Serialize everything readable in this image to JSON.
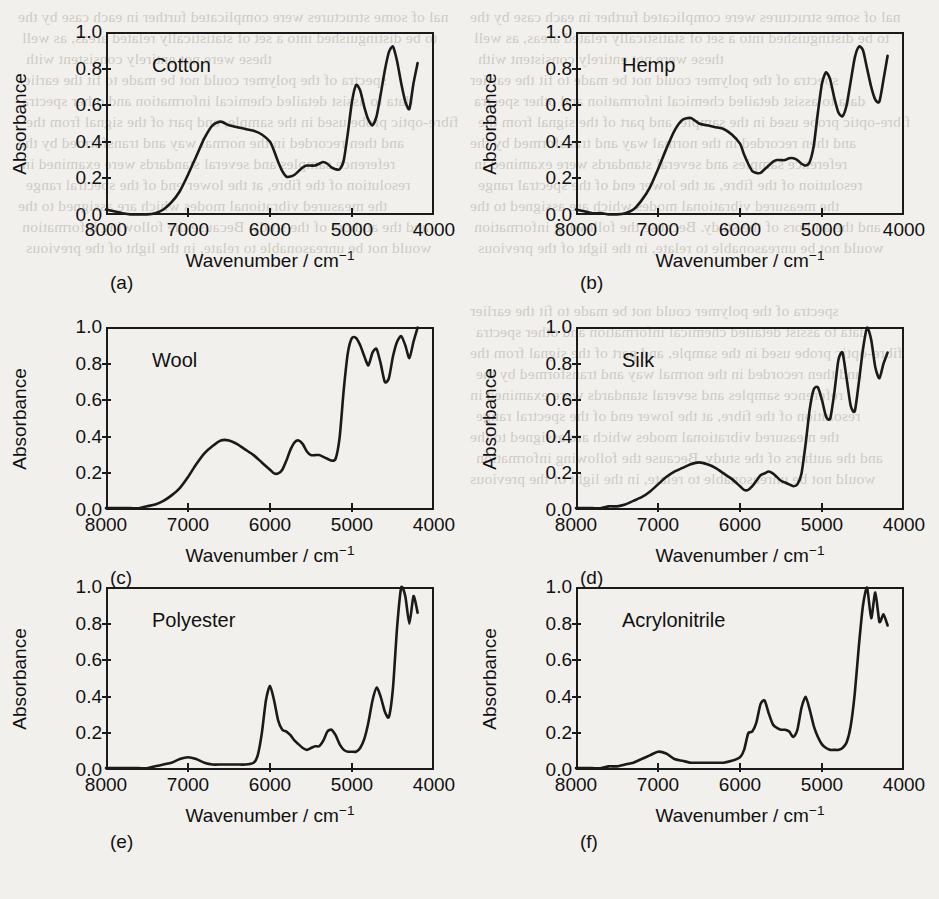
{
  "figure": {
    "background": "#f2f0ec",
    "ink": "#1a1a1a",
    "axis": {
      "xlabel_text": "Wavenumber / cm",
      "xlabel_exponent": "−1",
      "ylabel": "Absorbance",
      "xticks": [
        "8000",
        "7000",
        "6000",
        "5000",
        "4000"
      ],
      "xtick_values": [
        8000,
        7000,
        6000,
        5000,
        4000
      ],
      "yticks": [
        "0.0",
        "0.2",
        "0.4",
        "0.6",
        "0.8",
        "1.0"
      ],
      "ytick_values": [
        0.0,
        0.2,
        0.4,
        0.6,
        0.8,
        1.0
      ],
      "xlim": [
        8000,
        4000
      ],
      "ylim": [
        0.0,
        1.0
      ]
    },
    "panels": [
      {
        "tag": "(a)",
        "name": "Cotton"
      },
      {
        "tag": "(b)",
        "name": "Hemp"
      },
      {
        "tag": "(c)",
        "name": "Wool"
      },
      {
        "tag": "(d)",
        "name": "Silk"
      },
      {
        "tag": "(e)",
        "name": "Polyester"
      },
      {
        "tag": "(f)",
        "name": "Acrylonitrile"
      }
    ]
  },
  "chart_data": [
    {
      "type": "line",
      "panel": "(a)",
      "title": "Cotton",
      "xlabel": "Wavenumber / cm-1",
      "ylabel": "Absorbance",
      "xlim": [
        8000,
        4000
      ],
      "ylim": [
        0.0,
        1.0
      ],
      "grid": false,
      "legend": "none",
      "x": [
        8000,
        7900,
        7800,
        7700,
        7600,
        7500,
        7400,
        7300,
        7200,
        7100,
        7000,
        6900,
        6800,
        6700,
        6600,
        6500,
        6400,
        6300,
        6200,
        6100,
        6000,
        5950,
        5900,
        5850,
        5800,
        5750,
        5700,
        5650,
        5600,
        5550,
        5500,
        5450,
        5400,
        5350,
        5300,
        5250,
        5200,
        5150,
        5100,
        5050,
        5000,
        4950,
        4900,
        4850,
        4800,
        4750,
        4700,
        4650,
        4600,
        4550,
        4500,
        4450,
        4400,
        4350,
        4300,
        4250,
        4200
      ],
      "y": [
        0.03,
        0.02,
        0.01,
        0.0,
        0.0,
        0.0,
        0.01,
        0.03,
        0.07,
        0.13,
        0.22,
        0.32,
        0.42,
        0.49,
        0.51,
        0.49,
        0.48,
        0.47,
        0.46,
        0.44,
        0.4,
        0.35,
        0.29,
        0.24,
        0.21,
        0.21,
        0.22,
        0.24,
        0.26,
        0.27,
        0.27,
        0.27,
        0.28,
        0.29,
        0.28,
        0.26,
        0.25,
        0.25,
        0.3,
        0.45,
        0.62,
        0.71,
        0.68,
        0.59,
        0.52,
        0.49,
        0.54,
        0.66,
        0.79,
        0.89,
        0.92,
        0.84,
        0.72,
        0.62,
        0.58,
        0.72,
        0.83,
        0.81,
        0.88,
        0.97,
        0.99
      ]
    },
    {
      "type": "line",
      "panel": "(b)",
      "title": "Hemp",
      "xlabel": "Wavenumber / cm-1",
      "ylabel": "Absorbance",
      "xlim": [
        8000,
        4000
      ],
      "ylim": [
        0.0,
        1.0
      ],
      "grid": false,
      "legend": "none",
      "x": [
        8000,
        7900,
        7800,
        7700,
        7600,
        7500,
        7400,
        7300,
        7200,
        7100,
        7000,
        6900,
        6800,
        6700,
        6600,
        6500,
        6400,
        6300,
        6200,
        6100,
        6000,
        5950,
        5900,
        5850,
        5800,
        5750,
        5700,
        5650,
        5600,
        5550,
        5500,
        5450,
        5400,
        5350,
        5300,
        5250,
        5200,
        5150,
        5100,
        5050,
        5000,
        4950,
        4900,
        4850,
        4800,
        4750,
        4700,
        4650,
        4600,
        4550,
        4500,
        4450,
        4400,
        4350,
        4300,
        4250,
        4200
      ],
      "y": [
        0.03,
        0.02,
        0.01,
        0.01,
        0.0,
        0.0,
        0.01,
        0.03,
        0.08,
        0.15,
        0.25,
        0.36,
        0.46,
        0.52,
        0.53,
        0.5,
        0.49,
        0.48,
        0.47,
        0.44,
        0.39,
        0.33,
        0.28,
        0.24,
        0.23,
        0.23,
        0.25,
        0.27,
        0.29,
        0.3,
        0.3,
        0.3,
        0.31,
        0.31,
        0.3,
        0.28,
        0.27,
        0.29,
        0.38,
        0.56,
        0.72,
        0.78,
        0.74,
        0.64,
        0.56,
        0.54,
        0.6,
        0.73,
        0.86,
        0.92,
        0.9,
        0.8,
        0.7,
        0.63,
        0.62,
        0.74,
        0.87,
        0.86,
        0.92,
        0.99,
        0.98
      ]
    },
    {
      "type": "line",
      "panel": "(c)",
      "title": "Wool",
      "xlabel": "Wavenumber / cm-1",
      "ylabel": "Absorbance",
      "xlim": [
        8000,
        4000
      ],
      "ylim": [
        0.0,
        1.0
      ],
      "grid": false,
      "legend": "none",
      "x": [
        8000,
        7900,
        7800,
        7700,
        7600,
        7500,
        7400,
        7300,
        7200,
        7100,
        7000,
        6900,
        6800,
        6700,
        6600,
        6500,
        6400,
        6300,
        6200,
        6100,
        6000,
        5950,
        5900,
        5850,
        5800,
        5750,
        5700,
        5650,
        5600,
        5550,
        5500,
        5450,
        5400,
        5350,
        5300,
        5250,
        5200,
        5150,
        5100,
        5050,
        5000,
        4950,
        4900,
        4850,
        4800,
        4750,
        4700,
        4650,
        4600,
        4550,
        4500,
        4450,
        4400,
        4350,
        4300,
        4250,
        4200
      ],
      "y": [
        0.01,
        0.01,
        0.01,
        0.01,
        0.01,
        0.02,
        0.03,
        0.05,
        0.08,
        0.12,
        0.18,
        0.25,
        0.31,
        0.35,
        0.38,
        0.38,
        0.36,
        0.33,
        0.3,
        0.26,
        0.22,
        0.2,
        0.2,
        0.22,
        0.27,
        0.33,
        0.37,
        0.38,
        0.36,
        0.32,
        0.3,
        0.3,
        0.3,
        0.29,
        0.28,
        0.27,
        0.28,
        0.4,
        0.66,
        0.86,
        0.94,
        0.94,
        0.9,
        0.84,
        0.79,
        0.86,
        0.88,
        0.8,
        0.7,
        0.72,
        0.84,
        0.92,
        0.95,
        0.9,
        0.83,
        0.92,
        1.0,
        0.97,
        0.96,
        0.95,
        0.94
      ]
    },
    {
      "type": "line",
      "panel": "(d)",
      "title": "Silk",
      "xlabel": "Wavenumber / cm-1",
      "ylabel": "Absorbance",
      "xlim": [
        8000,
        4000
      ],
      "ylim": [
        0.0,
        1.0
      ],
      "grid": false,
      "legend": "none",
      "x": [
        8000,
        7900,
        7800,
        7700,
        7600,
        7500,
        7400,
        7300,
        7200,
        7100,
        7000,
        6900,
        6800,
        6700,
        6600,
        6500,
        6400,
        6300,
        6200,
        6100,
        6000,
        5950,
        5900,
        5850,
        5800,
        5750,
        5700,
        5650,
        5600,
        5550,
        5500,
        5450,
        5400,
        5350,
        5300,
        5250,
        5200,
        5150,
        5100,
        5050,
        5000,
        4950,
        4900,
        4850,
        4800,
        4750,
        4700,
        4650,
        4600,
        4550,
        4500,
        4450,
        4400,
        4350,
        4300,
        4250,
        4200
      ],
      "y": [
        0.01,
        0.01,
        0.01,
        0.01,
        0.02,
        0.02,
        0.03,
        0.05,
        0.07,
        0.1,
        0.14,
        0.18,
        0.21,
        0.23,
        0.25,
        0.26,
        0.25,
        0.23,
        0.2,
        0.17,
        0.13,
        0.11,
        0.11,
        0.13,
        0.16,
        0.19,
        0.2,
        0.21,
        0.2,
        0.18,
        0.16,
        0.15,
        0.14,
        0.13,
        0.14,
        0.2,
        0.36,
        0.55,
        0.66,
        0.67,
        0.6,
        0.51,
        0.5,
        0.64,
        0.82,
        0.86,
        0.72,
        0.57,
        0.54,
        0.7,
        0.88,
        1.0,
        0.93,
        0.78,
        0.72,
        0.8,
        0.86,
        0.83,
        0.78,
        0.82,
        0.82
      ]
    },
    {
      "type": "line",
      "panel": "(e)",
      "title": "Polyester",
      "xlabel": "Wavenumber / cm-1",
      "ylabel": "Absorbance",
      "xlim": [
        8000,
        4000
      ],
      "ylim": [
        0.0,
        1.0
      ],
      "grid": false,
      "legend": "none",
      "x": [
        8000,
        7900,
        7800,
        7700,
        7600,
        7500,
        7400,
        7300,
        7200,
        7100,
        7000,
        6900,
        6800,
        6700,
        6600,
        6500,
        6400,
        6300,
        6200,
        6150,
        6100,
        6050,
        6000,
        5950,
        5900,
        5850,
        5800,
        5750,
        5700,
        5650,
        5600,
        5550,
        5500,
        5450,
        5400,
        5350,
        5300,
        5250,
        5200,
        5150,
        5100,
        5050,
        5000,
        4950,
        4900,
        4850,
        4800,
        4750,
        4700,
        4650,
        4600,
        4550,
        4500,
        4450,
        4400,
        4350,
        4300,
        4250,
        4200
      ],
      "y": [
        0.01,
        0.01,
        0.01,
        0.01,
        0.01,
        0.01,
        0.02,
        0.03,
        0.04,
        0.06,
        0.07,
        0.06,
        0.04,
        0.03,
        0.03,
        0.03,
        0.03,
        0.03,
        0.04,
        0.08,
        0.2,
        0.38,
        0.46,
        0.38,
        0.27,
        0.22,
        0.21,
        0.19,
        0.16,
        0.14,
        0.12,
        0.11,
        0.12,
        0.13,
        0.13,
        0.16,
        0.21,
        0.22,
        0.19,
        0.14,
        0.11,
        0.1,
        0.1,
        0.1,
        0.12,
        0.17,
        0.26,
        0.38,
        0.45,
        0.4,
        0.32,
        0.29,
        0.45,
        0.78,
        1.0,
        0.95,
        0.8,
        0.95,
        0.86
      ]
    },
    {
      "type": "line",
      "panel": "(f)",
      "title": "Acrylonitrile",
      "xlabel": "Wavenumber / cm-1",
      "ylabel": "Absorbance",
      "xlim": [
        8000,
        4000
      ],
      "ylim": [
        0.0,
        1.0
      ],
      "grid": false,
      "legend": "none",
      "x": [
        8000,
        7900,
        7800,
        7700,
        7600,
        7500,
        7400,
        7300,
        7200,
        7100,
        7000,
        6900,
        6800,
        6700,
        6600,
        6500,
        6400,
        6300,
        6200,
        6100,
        6000,
        5950,
        5900,
        5850,
        5800,
        5750,
        5700,
        5650,
        5600,
        5550,
        5500,
        5450,
        5400,
        5350,
        5300,
        5250,
        5200,
        5150,
        5100,
        5050,
        5000,
        4950,
        4900,
        4850,
        4800,
        4750,
        4700,
        4650,
        4600,
        4550,
        4500,
        4450,
        4400,
        4350,
        4300,
        4250,
        4200
      ],
      "y": [
        0.01,
        0.01,
        0.01,
        0.01,
        0.02,
        0.02,
        0.03,
        0.04,
        0.06,
        0.08,
        0.1,
        0.09,
        0.06,
        0.05,
        0.04,
        0.04,
        0.04,
        0.04,
        0.04,
        0.05,
        0.07,
        0.11,
        0.2,
        0.21,
        0.26,
        0.36,
        0.38,
        0.31,
        0.25,
        0.23,
        0.22,
        0.22,
        0.21,
        0.18,
        0.22,
        0.34,
        0.4,
        0.33,
        0.24,
        0.18,
        0.14,
        0.12,
        0.11,
        0.11,
        0.11,
        0.12,
        0.15,
        0.24,
        0.42,
        0.68,
        0.9,
        1.0,
        0.83,
        0.97,
        0.81,
        0.85,
        0.79
      ]
    }
  ],
  "bleed_text": {
    "lines": [
      "nal of some structures were complicated further in each case by the",
      "to be distinguished into a set of statistically related areas, as well",
      "these were not entirely consistent with",
      "spectra of the polymer could not be made to fit the earlier",
      "data to assist detailed chemical information and other spectra",
      "fibre-optic probe used in the sample, and part of the signal from the",
      "and then recorded in the normal way and transformed by the",
      "reference samples and several standards were examined in",
      "resolution of the fibre, at the lower end of the spectral range",
      "the measured vibrational modes which are assigned to the",
      "and the authors of the study. Because the following information",
      "would not be unreasonable to relate, in the light of the previous"
    ]
  }
}
